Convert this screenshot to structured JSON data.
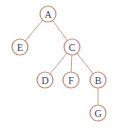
{
  "diagram": {
    "type": "tree",
    "colors": {
      "node_stroke": "#c98a7c",
      "edge": "#c9a49a",
      "label": "#3a3f55",
      "background": "#ffffff"
    },
    "nodes": [
      {
        "id": "A",
        "label": "A",
        "x": 48,
        "y": 14
      },
      {
        "id": "E",
        "label": "E",
        "x": 20,
        "y": 47
      },
      {
        "id": "C",
        "label": "C",
        "x": 72,
        "y": 47
      },
      {
        "id": "D",
        "label": "D",
        "x": 45,
        "y": 80
      },
      {
        "id": "F",
        "label": "F",
        "x": 71,
        "y": 80
      },
      {
        "id": "B",
        "label": "B",
        "x": 98,
        "y": 80
      },
      {
        "id": "G",
        "label": "G",
        "x": 98,
        "y": 113
      }
    ],
    "edges": [
      {
        "from": "A",
        "to": "E"
      },
      {
        "from": "A",
        "to": "C"
      },
      {
        "from": "C",
        "to": "D"
      },
      {
        "from": "C",
        "to": "F"
      },
      {
        "from": "C",
        "to": "B"
      },
      {
        "from": "B",
        "to": "G"
      }
    ]
  }
}
